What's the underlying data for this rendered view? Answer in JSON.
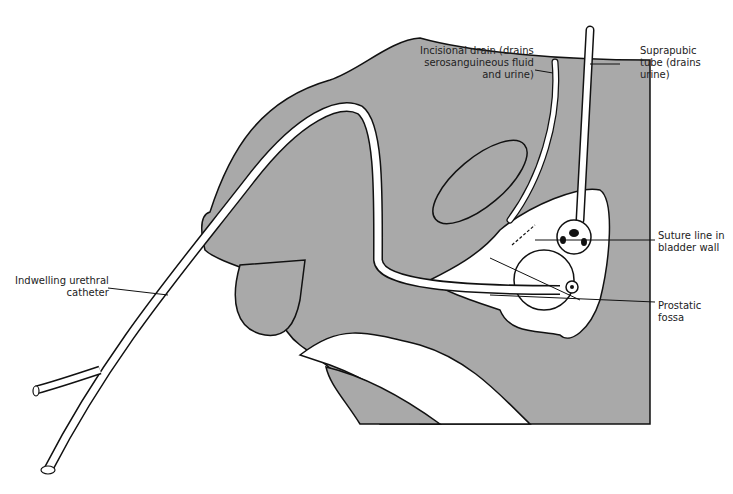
{
  "diagram": {
    "colors": {
      "tissue": "#a9a9a9",
      "outline": "#111111",
      "tube_fill": "#ffffff",
      "background": "#ffffff"
    },
    "labels": {
      "incisional_drain": [
        "Incisional drain (drains",
        "serosanguineous fluid",
        "and urine)"
      ],
      "suprapubic_tube": [
        "Suprapubic",
        "tube (drains",
        "urine)"
      ],
      "suture_line": [
        "Suture line in",
        "bladder wall"
      ],
      "prostatic_fossa": [
        "Prostatic",
        "fossa"
      ],
      "urethral_catheter": [
        "Indwelling urethral",
        "catheter"
      ]
    }
  }
}
